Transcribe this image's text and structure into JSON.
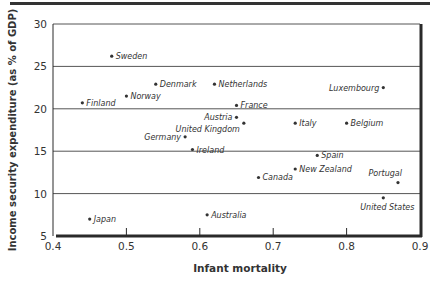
{
  "chart_data": {
    "type": "scatter",
    "title": "",
    "xlabel": "Infant mortality",
    "ylabel": "Income security expenditure (as % of GDP)",
    "xlim": [
      0.4,
      0.9
    ],
    "ylim": [
      5,
      30
    ],
    "x_ticks": [
      "0.4",
      "0.5",
      "0.6",
      "0.7",
      "0.8",
      "0.9"
    ],
    "y_ticks": [
      "5",
      "10",
      "15",
      "20",
      "25",
      "30"
    ],
    "grid": "horizontal",
    "legend": "none",
    "points": [
      {
        "label": "Sweden",
        "x": 0.48,
        "y": 26.2,
        "label_pos": "right"
      },
      {
        "label": "Denmark",
        "x": 0.54,
        "y": 22.9,
        "label_pos": "right"
      },
      {
        "label": "Netherlands",
        "x": 0.62,
        "y": 22.9,
        "label_pos": "right"
      },
      {
        "label": "Luxembourg",
        "x": 0.85,
        "y": 22.5,
        "label_pos": "left"
      },
      {
        "label": "Finland",
        "x": 0.44,
        "y": 20.7,
        "label_pos": "right"
      },
      {
        "label": "Norway",
        "x": 0.5,
        "y": 21.5,
        "label_pos": "right"
      },
      {
        "label": "France",
        "x": 0.65,
        "y": 20.4,
        "label_pos": "right"
      },
      {
        "label": "Austria",
        "x": 0.65,
        "y": 19.0,
        "label_pos": "left"
      },
      {
        "label": "United Kingdom",
        "x": 0.66,
        "y": 18.3,
        "label_pos": "below-left"
      },
      {
        "label": "Italy",
        "x": 0.73,
        "y": 18.3,
        "label_pos": "right"
      },
      {
        "label": "Belgium",
        "x": 0.8,
        "y": 18.3,
        "label_pos": "right"
      },
      {
        "label": "Germany",
        "x": 0.58,
        "y": 16.7,
        "label_pos": "left"
      },
      {
        "label": "Ireland",
        "x": 0.59,
        "y": 15.2,
        "label_pos": "right"
      },
      {
        "label": "Spain",
        "x": 0.76,
        "y": 14.5,
        "label_pos": "right"
      },
      {
        "label": "New Zealand",
        "x": 0.73,
        "y": 12.9,
        "label_pos": "right"
      },
      {
        "label": "Canada",
        "x": 0.68,
        "y": 11.9,
        "label_pos": "right"
      },
      {
        "label": "Portugal",
        "x": 0.87,
        "y": 11.3,
        "label_pos": "above"
      },
      {
        "label": "United States",
        "x": 0.85,
        "y": 9.5,
        "label_pos": "below"
      },
      {
        "label": "Japan",
        "x": 0.45,
        "y": 7.0,
        "label_pos": "right"
      },
      {
        "label": "Australia",
        "x": 0.61,
        "y": 7.5,
        "label_pos": "right"
      }
    ]
  },
  "colors": {
    "axis": "#2a2a2a",
    "grid": "#555555",
    "point": "#333333",
    "label": "#333333"
  }
}
